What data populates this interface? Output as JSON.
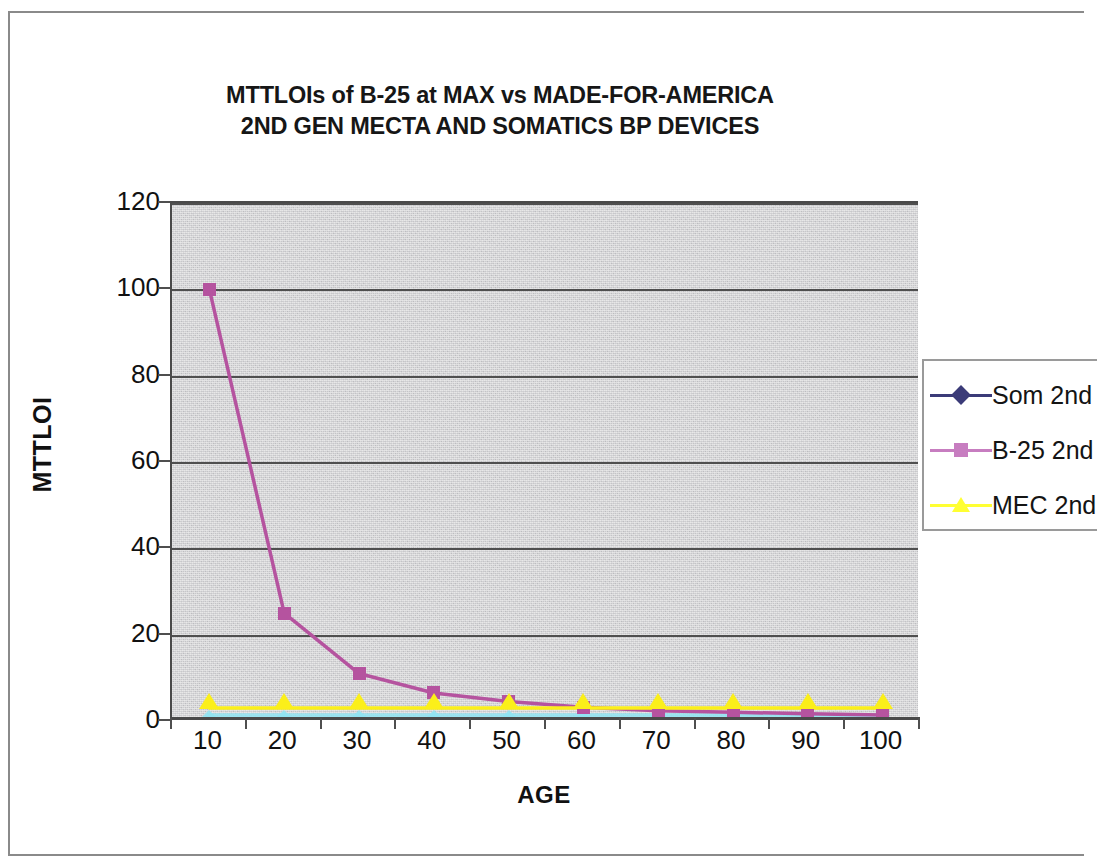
{
  "chart_data": {
    "type": "line",
    "title": "MTTLOIs of B-25 at MAX vs MADE-FOR-AMERICA 2ND GEN MECTA AND SOMATICS BP DEVICES",
    "title_lines": [
      "MTTLOIs of B-25 at MAX vs MADE-FOR-AMERICA",
      "2ND GEN MECTA AND SOMATICS BP DEVICES"
    ],
    "xlabel": "AGE",
    "ylabel": "MTTLOI",
    "x": [
      10,
      20,
      30,
      40,
      50,
      60,
      70,
      80,
      90,
      100
    ],
    "xtick_labels": [
      "10",
      "20",
      "30",
      "40",
      "50",
      "60",
      "70",
      "80",
      "90",
      "100"
    ],
    "ytick_labels": [
      "0",
      "20",
      "40",
      "60",
      "80",
      "100",
      "120"
    ],
    "yticks": [
      0,
      20,
      40,
      60,
      80,
      100,
      120
    ],
    "ylim": [
      0,
      120
    ],
    "xlim": [
      5,
      105
    ],
    "grid": "horizontal",
    "legend_position": "right",
    "series": [
      {
        "name": "Som 2nd",
        "marker": "diamond",
        "color": "#3b3b78",
        "plot_color": "#8fe4f2",
        "values": [
          1,
          1,
          1,
          1,
          1,
          1,
          1,
          1,
          1,
          1
        ]
      },
      {
        "name": "B-25 2nd",
        "marker": "square",
        "color": "#c77dc0",
        "plot_color": "#b5539f",
        "values": [
          100,
          25,
          11,
          6.5,
          4.5,
          3.2,
          2.4,
          2.0,
          1.7,
          1.4
        ]
      },
      {
        "name": "MEC 2nd",
        "marker": "triangle",
        "color": "#ffff33",
        "plot_color": "#fbef1a",
        "values": [
          3,
          3,
          3,
          3,
          3,
          3,
          3,
          3,
          3,
          3
        ]
      }
    ]
  },
  "colors": {
    "plot_background": "#d4d4d4",
    "page_background": "#ffffff",
    "axis": "#4a4a4a",
    "gridline": "#4f4f4f",
    "text": "#111111",
    "frame": "#8a8a8a"
  }
}
